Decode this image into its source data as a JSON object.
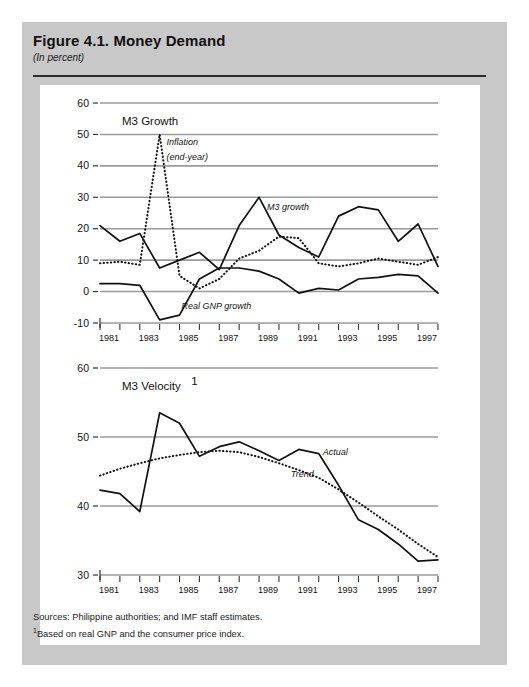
{
  "figure": {
    "title": "Figure 4.1.  Money Demand",
    "subtitle": "(In percent)",
    "sources_line1": "Sources:  Philippine authorities; and IMF staff estimates.",
    "sources_footnote_marker": "1",
    "sources_line2": "Based on real GNP and the consumer price index."
  },
  "colors": {
    "page_background": "#ffffff",
    "frame_background": "#c8c8c8",
    "plot_background": "#ffffff",
    "gridline": "#9a9a9a",
    "series_line": "#111111",
    "text": "#111111"
  },
  "chart_data": [
    {
      "type": "line",
      "id": "m3-growth",
      "title": "M3 Growth",
      "xlabel": "",
      "ylabel": "",
      "xlim": [
        1981,
        1998
      ],
      "ylim": [
        -10,
        60
      ],
      "yticks": [
        -10,
        0,
        10,
        20,
        30,
        40,
        50,
        60
      ],
      "xticks": [
        1981,
        1982,
        1983,
        1984,
        1985,
        1986,
        1987,
        1988,
        1989,
        1990,
        1991,
        1992,
        1993,
        1994,
        1995,
        1996,
        1997,
        1998
      ],
      "xtick_labels": [
        "1981",
        "",
        "1983",
        "",
        "1985",
        "",
        "1987",
        "",
        "1989",
        "",
        "1991",
        "",
        "1993",
        "",
        "1995",
        "",
        "1997",
        ""
      ],
      "grid": true,
      "legend_position": "inline-annotations",
      "annotations": [
        {
          "text": "Inflation",
          "x": 1984.35,
          "y": 46.5
        },
        {
          "text": "(end-year)",
          "x": 1984.35,
          "y": 42.0
        },
        {
          "text": "M3 growth",
          "x": 1989.4,
          "y": 26.0
        },
        {
          "text": "Real GNP growth",
          "x": 1985.1,
          "y": -5.5
        }
      ],
      "x": [
        1981,
        1982,
        1983,
        1984,
        1985,
        1986,
        1987,
        1988,
        1989,
        1990,
        1991,
        1992,
        1993,
        1994,
        1995,
        1996,
        1997,
        1998
      ],
      "series": [
        {
          "name": "M3 growth",
          "style": "solid",
          "values": [
            21.0,
            16.0,
            18.5,
            7.5,
            10.0,
            12.5,
            7.0,
            21.0,
            30.0,
            18.0,
            14.0,
            11.0,
            24.0,
            27.0,
            26.0,
            16.0,
            21.5,
            8.0
          ]
        },
        {
          "name": "Inflation (end-year)",
          "style": "dotted",
          "values": [
            9.0,
            9.5,
            8.5,
            50.0,
            5.0,
            1.0,
            4.0,
            10.5,
            13.0,
            17.5,
            17.0,
            9.0,
            8.0,
            9.0,
            10.5,
            9.5,
            8.5,
            11.0
          ]
        },
        {
          "name": "Real GNP growth",
          "style": "solid",
          "values": [
            2.5,
            2.5,
            2.0,
            -9.0,
            -7.5,
            4.0,
            7.5,
            7.5,
            6.5,
            4.0,
            -0.5,
            1.0,
            0.5,
            4.0,
            4.5,
            5.5,
            5.0,
            -0.5
          ]
        }
      ]
    },
    {
      "type": "line",
      "id": "m3-velocity",
      "title": "M3 Velocity",
      "title_footnote_marker": "1",
      "xlabel": "",
      "ylabel": "",
      "xlim": [
        1981,
        1998
      ],
      "ylim": [
        30,
        60
      ],
      "yticks": [
        30,
        40,
        50,
        60
      ],
      "xticks": [
        1981,
        1982,
        1983,
        1984,
        1985,
        1986,
        1987,
        1988,
        1989,
        1990,
        1991,
        1992,
        1993,
        1994,
        1995,
        1996,
        1997,
        1998
      ],
      "xtick_labels": [
        "1981",
        "",
        "1983",
        "",
        "1985",
        "",
        "1987",
        "",
        "1989",
        "",
        "1991",
        "",
        "1993",
        "",
        "1995",
        "",
        "1997",
        ""
      ],
      "grid": true,
      "legend_position": "inline-annotations",
      "annotations": [
        {
          "text": "Actual",
          "x": 1992.2,
          "y": 47.4
        },
        {
          "text": "Trend",
          "x": 1990.6,
          "y": 44.2
        }
      ],
      "x": [
        1981,
        1982,
        1983,
        1984,
        1985,
        1986,
        1987,
        1988,
        1989,
        1990,
        1991,
        1992,
        1993,
        1994,
        1995,
        1996,
        1997,
        1998
      ],
      "series": [
        {
          "name": "Actual",
          "style": "solid",
          "values": [
            42.3,
            41.8,
            39.2,
            53.5,
            52.0,
            47.2,
            48.6,
            49.3,
            48.0,
            46.6,
            48.2,
            47.6,
            43.0,
            38.0,
            36.6,
            34.5,
            32.0,
            32.2
          ]
        },
        {
          "name": "Trend",
          "style": "dotted",
          "values": [
            44.4,
            45.4,
            46.2,
            46.9,
            47.4,
            47.8,
            48.0,
            47.8,
            47.1,
            46.2,
            45.2,
            44.1,
            42.4,
            40.5,
            38.5,
            36.6,
            34.5,
            32.6
          ]
        }
      ]
    }
  ]
}
